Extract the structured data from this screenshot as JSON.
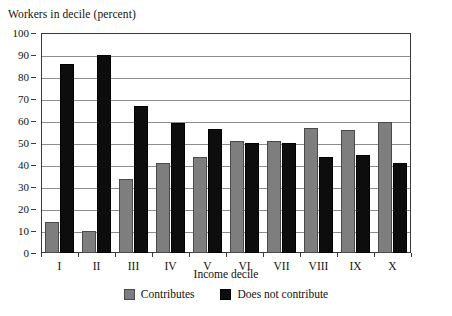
{
  "chart_data": {
    "type": "bar",
    "title": "Workers in decile (percent)",
    "xlabel": "Income decile",
    "ylabel": "",
    "ylim": [
      0,
      100
    ],
    "yticks": [
      0,
      10,
      20,
      30,
      40,
      50,
      60,
      70,
      80,
      90,
      100
    ],
    "grid": true,
    "legend_position": "bottom",
    "categories": [
      "I",
      "II",
      "III",
      "IV",
      "V",
      "VI",
      "VII",
      "VIII",
      "IX",
      "X"
    ],
    "series": [
      {
        "name": "Contributes",
        "color": "#7e7e7e",
        "values": [
          14,
          10,
          33.5,
          41,
          43.5,
          51,
          51,
          57,
          56,
          59.5
        ]
      },
      {
        "name": "Does not contribute",
        "color": "#0d0d0d",
        "values": [
          86,
          90,
          67,
          59,
          56.5,
          50,
          50,
          43.5,
          44.5,
          41
        ]
      }
    ]
  },
  "legend": {
    "items": [
      {
        "label": "Contributes",
        "swatch": "contributes"
      },
      {
        "label": "Does not contribute",
        "swatch": "not-contributes"
      }
    ]
  }
}
